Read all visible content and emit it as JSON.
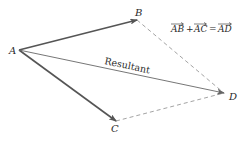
{
  "diagram": {
    "type": "vector-parallelogram",
    "points": {
      "A": {
        "label": "A",
        "x": 19,
        "y": 50
      },
      "B": {
        "label": "B",
        "x": 137,
        "y": 20
      },
      "C": {
        "label": "C",
        "x": 116,
        "y": 121
      },
      "D": {
        "label": "D",
        "x": 224,
        "y": 93
      }
    },
    "vectors": [
      {
        "from": "A",
        "to": "B",
        "style": "solid-bold"
      },
      {
        "from": "A",
        "to": "C",
        "style": "solid-bold"
      },
      {
        "from": "A",
        "to": "D",
        "style": "solid-thin",
        "label": "Resultant"
      }
    ],
    "dashed_edges": [
      {
        "from": "B",
        "to": "D"
      },
      {
        "from": "C",
        "to": "D"
      }
    ],
    "resultant_label": "Resultant",
    "equation": {
      "term1": "AB",
      "plus": "+",
      "term2": "AC",
      "equals": "=",
      "result": "AD"
    },
    "colors": {
      "vector": "#555555",
      "resultant": "#666666",
      "dashed": "#999999",
      "text": "#2a2a2a"
    }
  }
}
